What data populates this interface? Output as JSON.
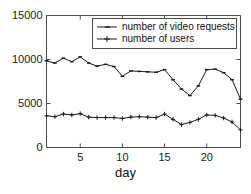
{
  "chart_data": {
    "type": "line",
    "title": "",
    "xlabel": "day",
    "ylabel": "",
    "xlim": [
      1,
      24
    ],
    "ylim": [
      0,
      15000
    ],
    "grid": false,
    "legend_position": "top-center",
    "x": [
      1,
      2,
      3,
      4,
      5,
      6,
      7,
      8,
      9,
      10,
      11,
      12,
      13,
      14,
      15,
      16,
      17,
      18,
      19,
      20,
      21,
      22,
      23,
      24
    ],
    "xticks": [
      5,
      10,
      15,
      20
    ],
    "xtick_labels": [
      "5",
      "10",
      "15",
      "20"
    ],
    "yticks": [
      0,
      5000,
      10000,
      15000
    ],
    "ytick_labels": [
      "0",
      "5000",
      "10000",
      "15000"
    ],
    "series": [
      {
        "name": "number of video requests",
        "marker": "dash",
        "color": "#1a1a1a",
        "values": [
          9850,
          9600,
          10150,
          9750,
          10300,
          9600,
          9250,
          9450,
          9200,
          8100,
          8700,
          8650,
          8600,
          8550,
          8850,
          7700,
          6650,
          5900,
          7000,
          8850,
          8900,
          8500,
          7700,
          5500
        ]
      },
      {
        "name": "number of users",
        "marker": "plus",
        "color": "#1a1a1a",
        "values": [
          3600,
          3500,
          3800,
          3700,
          3850,
          3450,
          3400,
          3400,
          3400,
          3300,
          3450,
          3500,
          3450,
          3400,
          3800,
          3200,
          2600,
          2850,
          3200,
          3700,
          3650,
          3350,
          2900,
          2000
        ]
      }
    ]
  },
  "legend": {
    "entries": [
      {
        "label": "number of video requests"
      },
      {
        "label": "number of users"
      }
    ]
  },
  "axis": {
    "x_title": "day"
  }
}
